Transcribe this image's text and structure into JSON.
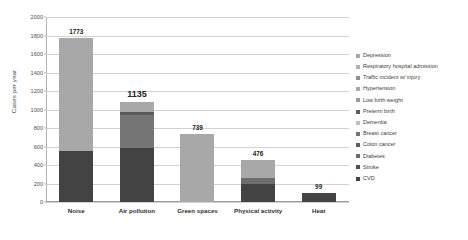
{
  "chart_data": {
    "type": "bar",
    "title": "",
    "subtitle": "",
    "xlabel": "",
    "ylabel": "Cases per year",
    "ylim": [
      0,
      2000
    ],
    "ytick_step": 200,
    "yticks": [
      "0",
      "200",
      "400",
      "600",
      "800",
      "1000",
      "1200",
      "1400",
      "1600",
      "1800",
      "2000"
    ],
    "grid": true,
    "stacked": true,
    "legend_position": "right",
    "categories": [
      "Noise",
      "Air pollution",
      "Green spaces",
      "Physical activity",
      "Heat"
    ],
    "totals": [
      1773,
      1135,
      739,
      476,
      99
    ],
    "data_labels": [
      "1773",
      "1135",
      "739",
      "476",
      "99"
    ],
    "emphasized_label": "1135",
    "series": [
      {
        "name": "CVD",
        "color": "#404040",
        "values": [
          555,
          580,
          0,
          200,
          99
        ]
      },
      {
        "name": "Stroke",
        "color": "#4f4f4f",
        "values": [
          0,
          0,
          0,
          0,
          0
        ]
      },
      {
        "name": "Diabetes",
        "color": "#5d5d5d",
        "values": [
          0,
          0,
          0,
          55,
          0
        ]
      },
      {
        "name": "Colon cancer",
        "color": "#6b6b6b",
        "values": [
          0,
          0,
          0,
          0,
          0
        ]
      },
      {
        "name": "Breast cancer",
        "color": "#7a7a7a",
        "values": [
          0,
          365,
          0,
          0,
          0
        ]
      },
      {
        "name": "Dementia",
        "color": "#8a8a8a",
        "values": [
          0,
          0,
          0,
          0,
          0
        ]
      },
      {
        "name": "Preterm birth",
        "color": "#5a5a5a",
        "values": [
          0,
          30,
          0,
          0,
          0
        ]
      },
      {
        "name": "Low birth weight",
        "color": "#9a9a9a",
        "values": [
          0,
          0,
          0,
          0,
          0
        ]
      },
      {
        "name": "Hypertension",
        "color": "#a8a8a8",
        "values": [
          0,
          110,
          0,
          0,
          0
        ]
      },
      {
        "name": "Traffic incident w/ injury",
        "color": "#8f8f8f",
        "values": [
          0,
          0,
          0,
          0,
          0
        ]
      },
      {
        "name": "Respiratory hospital admission",
        "color": "#b0b0b0",
        "values": [
          0,
          0,
          0,
          0,
          0
        ]
      },
      {
        "name": "Depression",
        "color": "#a9a9a9",
        "values": [
          1218,
          0,
          739,
          195,
          0
        ]
      }
    ],
    "stack_segments": [
      {
        "category": "Noise",
        "segments": [
          {
            "label": "CVD",
            "value": 555,
            "color": "#434343"
          },
          {
            "label": "Depression",
            "value": 1218,
            "color": "#a8a8a8"
          }
        ]
      },
      {
        "category": "Air pollution",
        "segments": [
          {
            "label": "CVD",
            "value": 580,
            "color": "#434343"
          },
          {
            "label": "Breast cancer",
            "value": 365,
            "color": "#757575"
          },
          {
            "label": "Preterm birth",
            "value": 30,
            "color": "#5c5c5c"
          },
          {
            "label": "Hypertension",
            "value": 110,
            "color": "#a8a8a8"
          }
        ]
      },
      {
        "category": "Green spaces",
        "segments": [
          {
            "label": "Depression",
            "value": 739,
            "color": "#a8a8a8"
          }
        ]
      },
      {
        "category": "Physical activity",
        "segments": [
          {
            "label": "CVD",
            "value": 200,
            "color": "#434343"
          },
          {
            "label": "Diabetes",
            "value": 55,
            "color": "#6e6e6e"
          },
          {
            "label": "Depression",
            "value": 195,
            "color": "#a8a8a8"
          }
        ]
      },
      {
        "category": "Heat",
        "segments": [
          {
            "label": "CVD",
            "value": 99,
            "color": "#434343"
          }
        ]
      }
    ]
  },
  "axis": {
    "y_title": "Cases per year"
  },
  "legend": {
    "items": [
      {
        "label": "Depression",
        "color": "#a8a8a8"
      },
      {
        "label": "Respiratory hospital admission",
        "color": "#b0b0b0"
      },
      {
        "label": "Traffic incident w/ injury",
        "color": "#8f8f8f"
      },
      {
        "label": "Hypertension",
        "color": "#a8a8a8"
      },
      {
        "label": "Low birth weight",
        "color": "#9a9a9a"
      },
      {
        "label": "Preterm birth",
        "color": "#5c5c5c"
      },
      {
        "label": "Dementia",
        "color": "#bdbdbd"
      },
      {
        "label": "Breast cancer",
        "color": "#757575"
      },
      {
        "label": "Colon cancer",
        "color": "#5d5d5d"
      },
      {
        "label": "Diabetes",
        "color": "#6e6e6e"
      },
      {
        "label": "Stroke",
        "color": "#4f4f4f"
      },
      {
        "label": "CVD",
        "color": "#434343"
      }
    ]
  }
}
